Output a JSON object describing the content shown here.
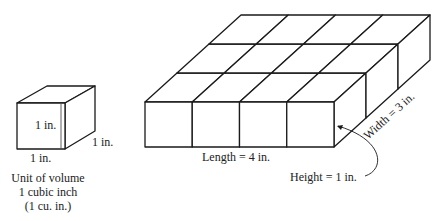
{
  "unit_cube": {
    "front_label": "1 in.",
    "bottom_label": "1 in.",
    "depth_label": "1 in.",
    "caption": [
      "Unit of volume",
      "1 cubic inch",
      "(1 cu. in.)"
    ]
  },
  "box": {
    "length_units": 4,
    "width_units": 3,
    "height_units": 1,
    "length_label": "Length = 4 in.",
    "width_label": "Width = 3 in.",
    "height_label": "Height = 1 in."
  }
}
